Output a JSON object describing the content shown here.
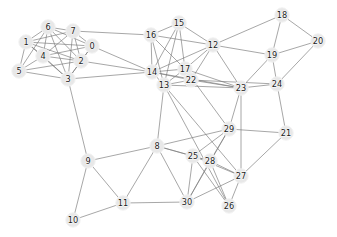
{
  "figure": {
    "title": "",
    "background_color": "#ffffff",
    "width": 337,
    "height": 237
  },
  "style": {
    "node_fill": "#e8e8e8",
    "node_stroke": "#f2f2f2",
    "node_radius": 7.2,
    "label_color": "#1a1a1a",
    "edge_color": "#7a7a7a",
    "edge_width": 0.7
  },
  "chart_data": {
    "type": "scatter",
    "title": "",
    "xlabel": "",
    "ylabel": "",
    "grid": false,
    "legend": null,
    "xlim": [
      0,
      337
    ],
    "ylim": [
      237,
      0
    ],
    "graph": {
      "directed": false,
      "node_count": 31,
      "edge_count": 97,
      "nodes": [
        {
          "id": "0",
          "label": "0",
          "x": 92,
          "y": 46
        },
        {
          "id": "1",
          "label": "1",
          "x": 26,
          "y": 42
        },
        {
          "id": "2",
          "label": "2",
          "x": 81,
          "y": 61
        },
        {
          "id": "3",
          "label": "3",
          "x": 68,
          "y": 79
        },
        {
          "id": "4",
          "label": "4",
          "x": 43,
          "y": 56
        },
        {
          "id": "5",
          "label": "5",
          "x": 19,
          "y": 71
        },
        {
          "id": "6",
          "label": "6",
          "x": 48,
          "y": 27
        },
        {
          "id": "7",
          "label": "7",
          "x": 73,
          "y": 31
        },
        {
          "id": "8",
          "label": "8",
          "x": 157,
          "y": 146
        },
        {
          "id": "9",
          "label": "9",
          "x": 88,
          "y": 161
        },
        {
          "id": "10",
          "label": "10",
          "x": 73,
          "y": 220
        },
        {
          "id": "11",
          "label": "11",
          "x": 123,
          "y": 203
        },
        {
          "id": "12",
          "label": "12",
          "x": 213,
          "y": 45
        },
        {
          "id": "13",
          "label": "13",
          "x": 164,
          "y": 85
        },
        {
          "id": "14",
          "label": "14",
          "x": 152,
          "y": 72
        },
        {
          "id": "15",
          "label": "15",
          "x": 179,
          "y": 23
        },
        {
          "id": "16",
          "label": "16",
          "x": 151,
          "y": 35
        },
        {
          "id": "17",
          "label": "17",
          "x": 185,
          "y": 69
        },
        {
          "id": "18",
          "label": "18",
          "x": 282,
          "y": 15
        },
        {
          "id": "19",
          "label": "19",
          "x": 272,
          "y": 55
        },
        {
          "id": "20",
          "label": "20",
          "x": 318,
          "y": 41
        },
        {
          "id": "21",
          "label": "21",
          "x": 286,
          "y": 133
        },
        {
          "id": "22",
          "label": "22",
          "x": 191,
          "y": 80
        },
        {
          "id": "23",
          "label": "23",
          "x": 241,
          "y": 88
        },
        {
          "id": "24",
          "label": "24",
          "x": 277,
          "y": 84
        },
        {
          "id": "25",
          "label": "25",
          "x": 193,
          "y": 156
        },
        {
          "id": "26",
          "label": "26",
          "x": 229,
          "y": 206
        },
        {
          "id": "27",
          "label": "27",
          "x": 241,
          "y": 176
        },
        {
          "id": "28",
          "label": "28",
          "x": 210,
          "y": 161
        },
        {
          "id": "29",
          "label": "29",
          "x": 229,
          "y": 129
        },
        {
          "id": "30",
          "label": "30",
          "x": 187,
          "y": 202
        }
      ],
      "edges": [
        [
          "0",
          "1"
        ],
        [
          "0",
          "2"
        ],
        [
          "0",
          "3"
        ],
        [
          "0",
          "4"
        ],
        [
          "0",
          "6"
        ],
        [
          "0",
          "7"
        ],
        [
          "0",
          "14"
        ],
        [
          "1",
          "2"
        ],
        [
          "1",
          "3"
        ],
        [
          "1",
          "4"
        ],
        [
          "1",
          "5"
        ],
        [
          "1",
          "6"
        ],
        [
          "1",
          "7"
        ],
        [
          "2",
          "3"
        ],
        [
          "2",
          "4"
        ],
        [
          "2",
          "5"
        ],
        [
          "2",
          "6"
        ],
        [
          "2",
          "7"
        ],
        [
          "2",
          "14"
        ],
        [
          "3",
          "4"
        ],
        [
          "3",
          "5"
        ],
        [
          "3",
          "6"
        ],
        [
          "3",
          "7"
        ],
        [
          "3",
          "9"
        ],
        [
          "3",
          "14"
        ],
        [
          "4",
          "5"
        ],
        [
          "4",
          "6"
        ],
        [
          "4",
          "7"
        ],
        [
          "4",
          "2"
        ],
        [
          "5",
          "6"
        ],
        [
          "5",
          "3"
        ],
        [
          "6",
          "7"
        ],
        [
          "7",
          "16"
        ],
        [
          "8",
          "9"
        ],
        [
          "8",
          "11"
        ],
        [
          "8",
          "13"
        ],
        [
          "8",
          "25"
        ],
        [
          "8",
          "28"
        ],
        [
          "8",
          "29"
        ],
        [
          "8",
          "30"
        ],
        [
          "9",
          "10"
        ],
        [
          "9",
          "11"
        ],
        [
          "10",
          "11"
        ],
        [
          "11",
          "30"
        ],
        [
          "12",
          "14"
        ],
        [
          "12",
          "15"
        ],
        [
          "12",
          "16"
        ],
        [
          "12",
          "17"
        ],
        [
          "12",
          "18"
        ],
        [
          "12",
          "19"
        ],
        [
          "12",
          "23"
        ],
        [
          "13",
          "14"
        ],
        [
          "13",
          "16"
        ],
        [
          "13",
          "15"
        ],
        [
          "13",
          "17"
        ],
        [
          "13",
          "22"
        ],
        [
          "13",
          "23"
        ],
        [
          "13",
          "27"
        ],
        [
          "13",
          "26"
        ],
        [
          "14",
          "15"
        ],
        [
          "14",
          "16"
        ],
        [
          "14",
          "17"
        ],
        [
          "14",
          "22"
        ],
        [
          "14",
          "23"
        ],
        [
          "15",
          "16"
        ],
        [
          "15",
          "17"
        ],
        [
          "16",
          "17"
        ],
        [
          "17",
          "22"
        ],
        [
          "17",
          "23"
        ],
        [
          "17",
          "29"
        ],
        [
          "18",
          "19"
        ],
        [
          "18",
          "20"
        ],
        [
          "19",
          "20"
        ],
        [
          "19",
          "23"
        ],
        [
          "19",
          "24"
        ],
        [
          "20",
          "24"
        ],
        [
          "21",
          "24"
        ],
        [
          "21",
          "27"
        ],
        [
          "21",
          "29"
        ],
        [
          "22",
          "23"
        ],
        [
          "22",
          "24"
        ],
        [
          "23",
          "24"
        ],
        [
          "23",
          "29"
        ],
        [
          "23",
          "27"
        ],
        [
          "24",
          "21"
        ],
        [
          "25",
          "26"
        ],
        [
          "25",
          "27"
        ],
        [
          "25",
          "28"
        ],
        [
          "25",
          "29"
        ],
        [
          "25",
          "30"
        ],
        [
          "26",
          "27"
        ],
        [
          "26",
          "28"
        ],
        [
          "27",
          "28"
        ],
        [
          "27",
          "30"
        ],
        [
          "28",
          "29"
        ],
        [
          "28",
          "30"
        ],
        [
          "29",
          "30"
        ],
        [
          "12",
          "22"
        ]
      ]
    }
  }
}
